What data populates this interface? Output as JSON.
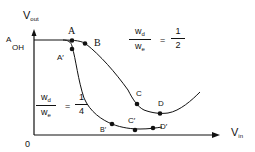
{
  "diagram": {
    "axes": {
      "y_label": "V",
      "y_label_sub": "out",
      "x_label": "V",
      "x_label_sub": "in",
      "origin": "0",
      "y_level_label": "A",
      "y_level_sub": "OH"
    },
    "curves": [
      {
        "name": "ratio-1-2",
        "ratio_num_main": "w",
        "ratio_num_sub": "d",
        "ratio_den_main": "w",
        "ratio_den_sub": "e",
        "equals": "=",
        "value_num": "1",
        "value_den": "2",
        "points": [
          "A",
          "B",
          "C",
          "D"
        ]
      },
      {
        "name": "ratio-1-4",
        "ratio_num_main": "w",
        "ratio_num_sub": "d",
        "ratio_den_main": "w",
        "ratio_den_sub": "e",
        "equals": "=",
        "value_num": "1",
        "value_den": "4",
        "points": [
          "A'",
          "B'",
          "C'",
          "D'"
        ]
      }
    ],
    "point_labels": {
      "A": "A",
      "B": "B",
      "C": "C",
      "D": "D",
      "A_prime": "A′",
      "B_prime": "B′",
      "C_prime": "C′",
      "D_prime": "D′"
    },
    "colors": {
      "line": "#111111",
      "background": "#ffffff"
    }
  }
}
